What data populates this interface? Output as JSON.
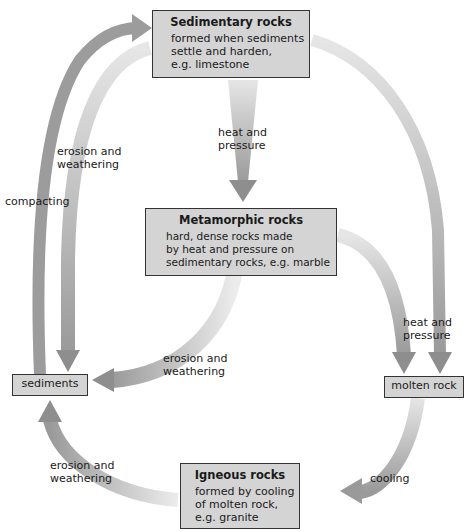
{
  "diagram": {
    "type": "rock cycle",
    "nodes": {
      "sedimentary": {
        "title": "Sedimentary rocks",
        "desc1": "formed when sediments",
        "desc2": "settle and harden,",
        "desc3": "e.g. limestone"
      },
      "metamorphic": {
        "title": "Metamorphic rocks",
        "desc1": "hard, dense rocks made",
        "desc2": "by heat and pressure on",
        "desc3": "sedimentary rocks, e.g. marble"
      },
      "igneous": {
        "title": "Igneous rocks",
        "desc1": "formed by cooling",
        "desc2": "of molten rock,",
        "desc3": "e.g. granite"
      },
      "sediments": {
        "label": "sediments"
      },
      "molten": {
        "label": "molten rock"
      }
    },
    "edge_labels": {
      "sed_to_met_1": "heat and",
      "sed_to_met_2": "pressure",
      "sed_to_sediments_1": "erosion and",
      "sed_to_sediments_2": "weathering",
      "compacting": "compacting",
      "met_to_sediments_1": "erosion and",
      "met_to_sediments_2": "weathering",
      "to_molten_1": "heat and",
      "to_molten_2": "pressure",
      "ign_to_sediments_1": "erosion and",
      "ign_to_sediments_2": "weathering",
      "cooling": "cooling"
    },
    "colors": {
      "box_fill": "#d4d4d4",
      "box_border": "#333333",
      "arrow": "#9a9a9a",
      "arrow_dark": "#8a8a8a"
    }
  }
}
